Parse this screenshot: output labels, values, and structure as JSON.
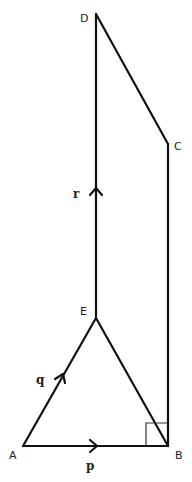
{
  "diagram": {
    "type": "geometry-vector-figure",
    "points": {
      "A": {
        "label": "A",
        "x": 23,
        "y": 446
      },
      "B": {
        "label": "B",
        "x": 168,
        "y": 446
      },
      "C": {
        "label": "C",
        "x": 168,
        "y": 144
      },
      "D": {
        "label": "D",
        "x": 96,
        "y": 14
      },
      "E": {
        "label": "E",
        "x": 96,
        "y": 318
      }
    },
    "vectors": {
      "p": {
        "label": "p",
        "from": "A",
        "to": "B"
      },
      "q": {
        "label": "q",
        "from": "A",
        "to": "E"
      },
      "r": {
        "label": "r",
        "from": "E",
        "to": "D"
      }
    },
    "segments": [
      "AB",
      "AE",
      "EB",
      "ED",
      "DC",
      "CB"
    ],
    "right_angle_at": "B",
    "stroke_color": "#111111",
    "background": "#ffffff"
  }
}
